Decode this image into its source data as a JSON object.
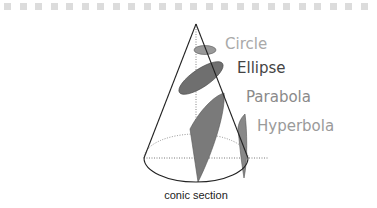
{
  "figure": {
    "caption": "conic section",
    "labels": {
      "circle": "Circle",
      "ellipse": "Ellipse",
      "parabola": "Parabola",
      "hyperbola": "Hyperbola"
    },
    "colors": {
      "circle_label": "#a9a9a9",
      "ellipse_label": "#444444",
      "parabola_label": "#8a8a8a",
      "hyperbola_label": "#9a9a9a",
      "section_fill": "#777777",
      "circle_fill": "#999999",
      "cone_stroke": "#222222",
      "border_dash": "#dcdcdc"
    }
  }
}
